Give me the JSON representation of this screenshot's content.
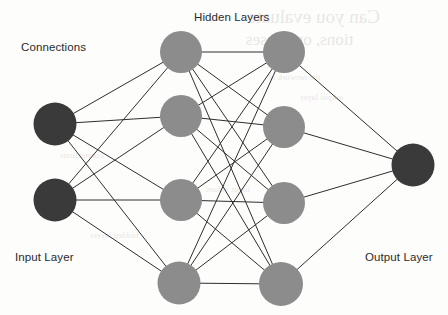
{
  "figure": {
    "labels": {
      "connections": "Connections",
      "hidden_layers": "Hidden Layers",
      "input_layer": "Input Layer",
      "output_layer": "Output Layer"
    },
    "colors": {
      "background": "#fdfdfc",
      "input_output_node": "#3a3a3a",
      "hidden_node": "#8c8c8c",
      "connection_line": "#2e2e2e",
      "label_text": "#2b2b2b"
    },
    "style": {
      "connection_width": 1,
      "node_radius": 21
    },
    "layers": [
      {
        "id": "input",
        "name": "Input Layer",
        "kind": "input",
        "fill": "#3a3a3a",
        "nodes": [
          {
            "id": "i1",
            "cx": 55,
            "cy": 124,
            "r": 21.5
          },
          {
            "id": "i2",
            "cx": 55,
            "cy": 200,
            "r": 21.5
          }
        ]
      },
      {
        "id": "hidden1",
        "name": "Hidden Layer 1",
        "kind": "hidden",
        "fill": "#8c8c8c",
        "nodes": [
          {
            "id": "h1a",
            "cx": 181,
            "cy": 52,
            "r": 21
          },
          {
            "id": "h1b",
            "cx": 181,
            "cy": 116,
            "r": 21
          },
          {
            "id": "h1c",
            "cx": 181,
            "cy": 200,
            "r": 21
          },
          {
            "id": "h1d",
            "cx": 179,
            "cy": 283,
            "r": 21.5
          }
        ]
      },
      {
        "id": "hidden2",
        "name": "Hidden Layer 2",
        "kind": "hidden",
        "fill": "#8c8c8c",
        "nodes": [
          {
            "id": "h2a",
            "cx": 284,
            "cy": 52,
            "r": 21
          },
          {
            "id": "h2b",
            "cx": 284,
            "cy": 127,
            "r": 21
          },
          {
            "id": "h2c",
            "cx": 284,
            "cy": 203,
            "r": 21
          },
          {
            "id": "h2d",
            "cx": 281,
            "cy": 284,
            "r": 22
          }
        ]
      },
      {
        "id": "output",
        "name": "Output Layer",
        "kind": "output",
        "fill": "#3a3a3a",
        "nodes": [
          {
            "id": "o1",
            "cx": 413,
            "cy": 165,
            "r": 21.5
          }
        ]
      }
    ],
    "connection_groups": [
      {
        "from_layer": "input",
        "to_layer": "hidden1",
        "fully_connected": true
      },
      {
        "from_layer": "hidden1",
        "to_layer": "hidden2",
        "fully_connected": true
      },
      {
        "from_layer": "hidden2",
        "to_layer": "output",
        "fully_connected": true
      }
    ],
    "background_bleed_through": [
      {
        "text": "Can you evaluate",
        "left": 248,
        "top": 6,
        "size": 19
      },
      {
        "text": "tions, or classes",
        "left": 246,
        "top": 30,
        "size": 17
      },
      {
        "text": "the network of",
        "left": 268,
        "top": 72,
        "size": 9
      },
      {
        "text": "output layer",
        "left": 300,
        "top": 92,
        "size": 9
      },
      {
        "text": "connections",
        "left": 60,
        "top": 150,
        "size": 9
      },
      {
        "text": "hidden layers",
        "left": 90,
        "top": 230,
        "size": 9
      },
      {
        "text": "input values",
        "left": 206,
        "top": 184,
        "size": 9
      }
    ]
  }
}
